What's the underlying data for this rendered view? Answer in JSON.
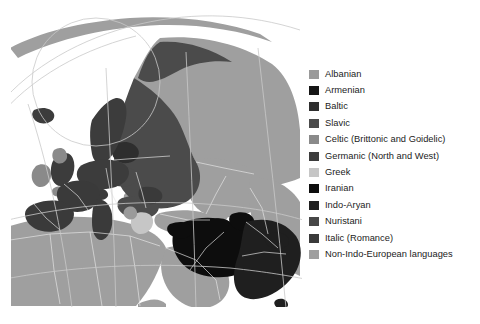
{
  "figure": {
    "type": "thematic-map",
    "background_color": "#ffffff",
    "projection": "orthographic globe centered on Eurasia",
    "rendering": "grayscale"
  },
  "map": {
    "ocean_color": "#ffffff",
    "border_color": "#e8e8e8",
    "graticule_color": "#cfcfcf",
    "outline_color": "#bdbdbd",
    "regions": [
      {
        "name": "Scandinavia",
        "branch": "Germanic (North and West)"
      },
      {
        "name": "British Isles",
        "branch": "Celtic (Brittonic and Goidelic)"
      },
      {
        "name": "Central Europe",
        "branch": "Germanic (North and West)"
      },
      {
        "name": "Eastern Europe and Russia",
        "branch": "Slavic"
      },
      {
        "name": "Baltic states",
        "branch": "Baltic"
      },
      {
        "name": "Iberia, France, Italy, Romania",
        "branch": "Italic (Romance)"
      },
      {
        "name": "Greece",
        "branch": "Greek"
      },
      {
        "name": "Albania",
        "branch": "Albanian"
      },
      {
        "name": "Armenia and Caucasus",
        "branch": "Armenian"
      },
      {
        "name": "Iran, Afghanistan, Kurdistan",
        "branch": "Iranian"
      },
      {
        "name": "Northern India and Pakistan",
        "branch": "Indo-Aryan"
      },
      {
        "name": "Hindu Kush",
        "branch": "Nuristani"
      },
      {
        "name": "North Africa, Arabia, Turkey, Central and East Asia, Finland, Hungary",
        "branch": "Non-Indo-European languages"
      }
    ]
  },
  "legend": {
    "items": [
      {
        "label": "Albanian",
        "color": "#9a9a9a"
      },
      {
        "label": "Armenian",
        "color": "#161616"
      },
      {
        "label": "Baltic",
        "color": "#2e2e2e"
      },
      {
        "label": "Slavic",
        "color": "#4b4b4b"
      },
      {
        "label": "Celtic (Brittonic and Goidelic)",
        "color": "#8a8a8a"
      },
      {
        "label": "Germanic (North and West)",
        "color": "#3c3c3c"
      },
      {
        "label": "Greek",
        "color": "#c6c6c6"
      },
      {
        "label": "Iranian",
        "color": "#0d0d0d"
      },
      {
        "label": "Indo-Aryan",
        "color": "#1f1f1f"
      },
      {
        "label": "Nuristani",
        "color": "#474747"
      },
      {
        "label": "Italic (Romance)",
        "color": "#3a3a3a"
      },
      {
        "label": "Non-Indo-European languages",
        "color": "#9f9f9f"
      }
    ]
  }
}
